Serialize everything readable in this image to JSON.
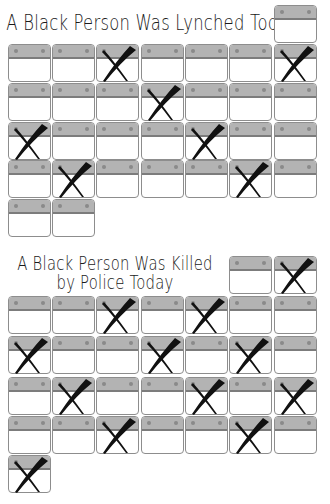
{
  "colors": {
    "background": "#ffffff",
    "cell_border": "#8d8d8d",
    "cell_band": "#b3b3b3",
    "cell_band_line": "#7c7c7c",
    "cell_dot": "#8a8a8a",
    "x_mark": "#111111"
  },
  "layout": {
    "col_x": [
      8,
      52,
      96,
      141,
      185,
      229,
      274
    ],
    "cell_w": 44,
    "cell_h": 39
  },
  "panels": [
    {
      "id": "lynched",
      "title_lines": [
        "A Black Person Was Lynched Today"
      ],
      "cells": [
        {
          "col": 7,
          "y": 5,
          "x_mark": false
        },
        {
          "col": 1,
          "y": 44,
          "x_mark": false
        },
        {
          "col": 2,
          "y": 44,
          "x_mark": false
        },
        {
          "col": 3,
          "y": 44,
          "x_mark": true
        },
        {
          "col": 4,
          "y": 44,
          "x_mark": false
        },
        {
          "col": 5,
          "y": 44,
          "x_mark": false
        },
        {
          "col": 6,
          "y": 44,
          "x_mark": false
        },
        {
          "col": 7,
          "y": 44,
          "x_mark": true
        },
        {
          "col": 1,
          "y": 83,
          "x_mark": false
        },
        {
          "col": 2,
          "y": 83,
          "x_mark": false
        },
        {
          "col": 3,
          "y": 83,
          "x_mark": false
        },
        {
          "col": 4,
          "y": 83,
          "x_mark": true
        },
        {
          "col": 5,
          "y": 83,
          "x_mark": false
        },
        {
          "col": 6,
          "y": 83,
          "x_mark": false
        },
        {
          "col": 7,
          "y": 83,
          "x_mark": false
        },
        {
          "col": 1,
          "y": 122,
          "x_mark": true
        },
        {
          "col": 2,
          "y": 122,
          "x_mark": false
        },
        {
          "col": 3,
          "y": 122,
          "x_mark": false
        },
        {
          "col": 4,
          "y": 122,
          "x_mark": false
        },
        {
          "col": 5,
          "y": 122,
          "x_mark": true
        },
        {
          "col": 6,
          "y": 122,
          "x_mark": false
        },
        {
          "col": 7,
          "y": 122,
          "x_mark": false
        },
        {
          "col": 1,
          "y": 160,
          "x_mark": false
        },
        {
          "col": 2,
          "y": 160,
          "x_mark": true
        },
        {
          "col": 3,
          "y": 160,
          "x_mark": false
        },
        {
          "col": 4,
          "y": 160,
          "x_mark": false
        },
        {
          "col": 5,
          "y": 160,
          "x_mark": false
        },
        {
          "col": 6,
          "y": 160,
          "x_mark": true
        },
        {
          "col": 7,
          "y": 160,
          "x_mark": false
        },
        {
          "col": 1,
          "y": 199,
          "x_mark": false
        },
        {
          "col": 2,
          "y": 199,
          "x_mark": false
        }
      ],
      "total_days": 31,
      "marked_days": 7
    },
    {
      "id": "killed-by-police",
      "title_lines": [
        "A Black Person Was Killed",
        "by Police Today"
      ],
      "cells": [
        {
          "col": 6,
          "y": 256,
          "x_mark": false
        },
        {
          "col": 7,
          "y": 256,
          "x_mark": true
        },
        {
          "col": 1,
          "y": 296,
          "x_mark": false
        },
        {
          "col": 2,
          "y": 296,
          "x_mark": false
        },
        {
          "col": 3,
          "y": 296,
          "x_mark": true
        },
        {
          "col": 4,
          "y": 296,
          "x_mark": false
        },
        {
          "col": 5,
          "y": 296,
          "x_mark": true
        },
        {
          "col": 6,
          "y": 296,
          "x_mark": false
        },
        {
          "col": 7,
          "y": 296,
          "x_mark": false
        },
        {
          "col": 1,
          "y": 336,
          "x_mark": true
        },
        {
          "col": 2,
          "y": 336,
          "x_mark": false
        },
        {
          "col": 3,
          "y": 336,
          "x_mark": false
        },
        {
          "col": 4,
          "y": 336,
          "x_mark": true
        },
        {
          "col": 5,
          "y": 336,
          "x_mark": false
        },
        {
          "col": 6,
          "y": 336,
          "x_mark": true
        },
        {
          "col": 7,
          "y": 336,
          "x_mark": false
        },
        {
          "col": 1,
          "y": 377,
          "x_mark": false
        },
        {
          "col": 2,
          "y": 377,
          "x_mark": true
        },
        {
          "col": 3,
          "y": 377,
          "x_mark": false
        },
        {
          "col": 4,
          "y": 377,
          "x_mark": false
        },
        {
          "col": 5,
          "y": 377,
          "x_mark": true
        },
        {
          "col": 6,
          "y": 377,
          "x_mark": false
        },
        {
          "col": 7,
          "y": 377,
          "x_mark": true
        },
        {
          "col": 1,
          "y": 416,
          "x_mark": false
        },
        {
          "col": 2,
          "y": 416,
          "x_mark": false
        },
        {
          "col": 3,
          "y": 416,
          "x_mark": true
        },
        {
          "col": 4,
          "y": 416,
          "x_mark": false
        },
        {
          "col": 5,
          "y": 416,
          "x_mark": false
        },
        {
          "col": 6,
          "y": 416,
          "x_mark": true
        },
        {
          "col": 7,
          "y": 416,
          "x_mark": false
        },
        {
          "col": 1,
          "y": 455,
          "x_mark": true
        }
      ],
      "total_days": 31,
      "marked_days": 13
    }
  ]
}
